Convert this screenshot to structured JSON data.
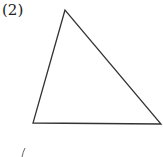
{
  "problem": {
    "label": "(2)"
  },
  "figure": {
    "shape": "triangle",
    "vertices": {
      "apex": [
        65,
        10
      ],
      "bottom_left": [
        33,
        123
      ],
      "bottom_right": [
        161,
        124
      ]
    },
    "stroke_color": "#333333",
    "fill": "none"
  },
  "fragment": {
    "glyph": "/"
  }
}
